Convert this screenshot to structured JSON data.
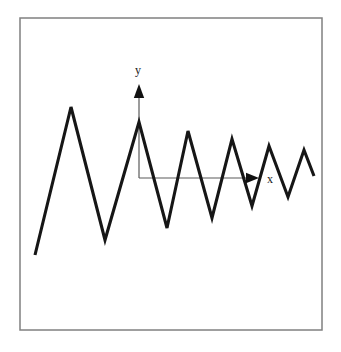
{
  "figure": {
    "title": "",
    "caption": "",
    "background_color": "#ffffff",
    "frame": {
      "name": "figure-border",
      "x": 20,
      "y": 18,
      "width": 302,
      "height": 312,
      "stroke_color": "#808080",
      "stroke_width": 1.5
    },
    "axes": {
      "origin": {
        "x": 139,
        "y": 178
      },
      "stroke_color": "#5a5a5a",
      "stroke_width": 1.2,
      "y_axis": {
        "label": "y",
        "label_x": 138,
        "label_y": 74,
        "from_y": 178,
        "to_y": 92,
        "arrow_tip_y": 84,
        "arrow_color": "#111111"
      },
      "x_axis": {
        "label": "x",
        "label_x": 270,
        "label_y": 183,
        "from_x": 139,
        "to_x": 250,
        "arrow_tip_x": 259,
        "arrow_color": "#111111"
      }
    },
    "curve": {
      "name": "damped-zigzag-waveform",
      "stroke_color": "#161616",
      "stroke_width": 3.1,
      "description": "damped oscillation drawn as straight-line zigzag with decaying amplitude",
      "points": [
        {
          "x": 35,
          "y": 255
        },
        {
          "x": 71,
          "y": 107
        },
        {
          "x": 105,
          "y": 240
        },
        {
          "x": 139,
          "y": 122
        },
        {
          "x": 167,
          "y": 228
        },
        {
          "x": 188,
          "y": 131
        },
        {
          "x": 212,
          "y": 218
        },
        {
          "x": 232,
          "y": 139
        },
        {
          "x": 252,
          "y": 206
        },
        {
          "x": 269,
          "y": 146
        },
        {
          "x": 288,
          "y": 197
        },
        {
          "x": 304,
          "y": 150
        },
        {
          "x": 314,
          "y": 176
        }
      ]
    }
  },
  "chart_data": {
    "type": "line",
    "title": "",
    "xlabel": "x",
    "ylabel": "y",
    "grid": false,
    "legend": "none",
    "axis_style": "arrow-axes-centered",
    "series": [
      {
        "name": "damped zigzag oscillation",
        "x": [
          35,
          71,
          105,
          139,
          167,
          188,
          212,
          232,
          252,
          269,
          288,
          304,
          314
        ],
        "y": [
          255,
          107,
          240,
          122,
          228,
          131,
          218,
          139,
          206,
          146,
          197,
          150,
          176
        ]
      }
    ],
    "annotations": [
      "y",
      "x"
    ]
  }
}
